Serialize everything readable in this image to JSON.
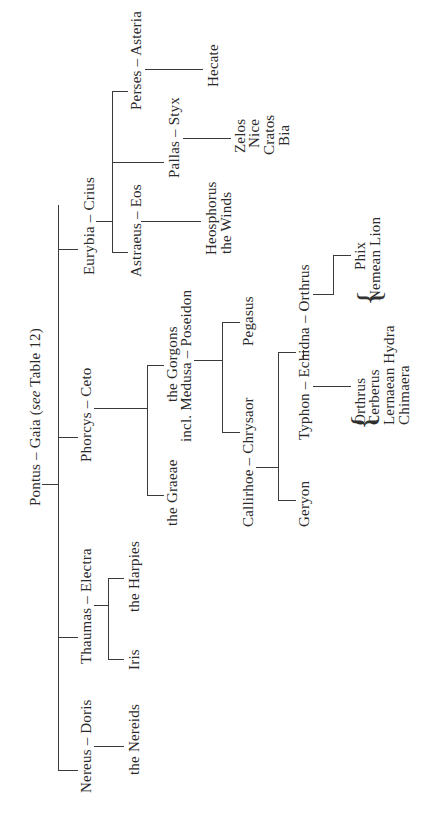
{
  "diagram": {
    "orientation": "rotated -90deg (reads bottom-to-top)",
    "root": {
      "label": "Pontus – Gaia",
      "note_prefix": "(",
      "note_italic": "see",
      "note_suffix": " Table 12)"
    },
    "children": [
      {
        "couple": "Nereus – Doris",
        "offspring": [
          "the Nereids"
        ]
      },
      {
        "couple": "Thaumas – Electra",
        "offspring": [
          "Iris",
          "the Harpies"
        ]
      },
      {
        "couple": "Phorcys – Ceto",
        "offspring": [
          "the Graeae",
          {
            "line1": "the Gorgons",
            "line2": "incl. Medusa – Poseidon"
          }
        ],
        "medusa_poseidon_offspring": [
          "Callirhoe – Chrysaor",
          "Pegasus"
        ],
        "callirhoe_chrysaor_offspring": [
          "Geryon",
          "Typhon – Echidna – Orthrus"
        ],
        "typhon_echidna_offspring": [
          "Orthrus",
          "Cerberus",
          "Lernaean Hydra",
          "Chimaera"
        ],
        "echidna_orthrus_offspring": [
          "Phix",
          "Nemean Lion"
        ]
      },
      {
        "couple": "Eurybia – Crius",
        "offspring": [
          "Astraeus – Eos",
          "Pallas – Styx",
          "Perses – Asteria"
        ],
        "astraeus_eos_offspring": [
          "Heosphorus",
          "the Winds"
        ],
        "pallas_styx_offspring": [
          "Zelos",
          "Nice",
          "Cratos",
          "Bia"
        ],
        "perses_asteria_offspring": [
          "Hecate"
        ]
      }
    ]
  }
}
